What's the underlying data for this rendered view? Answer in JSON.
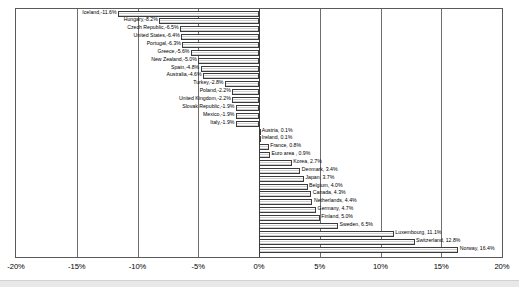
{
  "chart_data": {
    "type": "bar",
    "orientation": "horizontal",
    "title": "",
    "xlabel": "",
    "ylabel": "",
    "xlim": [
      -20,
      20
    ],
    "grid": true,
    "legend": "none",
    "xticks": [
      "-20%",
      "-15%",
      "-10%",
      "-5%",
      "0%",
      "5%",
      "10%",
      "15%",
      "20%"
    ],
    "xtick_values": [
      -20,
      -15,
      -10,
      -5,
      0,
      5,
      10,
      15,
      20
    ],
    "categories": [
      "Iceland",
      "Hungary",
      "Czech Republic",
      "United States",
      "Portugal",
      "Greece",
      "New Zealand",
      "Spain",
      "Australia",
      "Turkey",
      "Poland",
      "United Kingdom",
      "Slovak Republic",
      "Mexico",
      "Italy",
      "Austria",
      "Ireland",
      "France",
      "Euro area",
      "Korea",
      "Denmark",
      "Japan",
      "Belgium",
      "Canada",
      "Netherlands",
      "Germany",
      "Finland",
      "Sweden",
      "Luxembourg",
      "Switzerland",
      "Norway"
    ],
    "values": [
      -11.6,
      -8.2,
      -6.5,
      -6.4,
      -6.3,
      -5.6,
      -5.0,
      -4.8,
      -4.6,
      -2.8,
      -2.2,
      -2.2,
      -1.9,
      -1.9,
      -1.9,
      0.1,
      0.1,
      0.8,
      0.9,
      2.7,
      3.4,
      3.7,
      4.0,
      4.3,
      4.4,
      4.7,
      5.0,
      6.5,
      11.1,
      12.8,
      16.4
    ],
    "point_labels": [
      "Iceland,-11.6%",
      "Hungary,-8.2%",
      "Czech Republic,-6.5%",
      "United States,-6.4%",
      "Portugal,-6.3%",
      "Greece,-5.6%",
      "New Zealand,-5.0%",
      "Spain,-4.8%",
      "Australia,-4.6%",
      "Turkey,-2.8%",
      "Poland,-2.2%",
      "United Kingdom,-2.2%",
      "Slovak Republic,-1.9%",
      "Mexico,-1.9%",
      "Italy,-1.9%",
      "Austria, 0.1%",
      "Ireland, 0.1%",
      "France, 0.8%",
      "Euro area , 0.9%",
      "Korea, 2.7%",
      "Denmark, 3.4%",
      "Japan, 3.7%",
      "Belgium, 4.0%",
      "Canada, 4.3%",
      "Netherlands, 4.4%",
      "Germany, 4.7%",
      "Finland, 5.0%",
      "Sweden, 6.5%",
      "Luxembourg, 11.1%",
      "Switzerland, 12.8%",
      "Norway, 16.4%"
    ]
  },
  "colors": {
    "bar_border": "#3c3c3c",
    "bar_fill": "#f2f2f2",
    "axis": "#5a5a5a",
    "gridline": "#6e6e6e",
    "text": "#000000",
    "background": "#ffffff"
  }
}
